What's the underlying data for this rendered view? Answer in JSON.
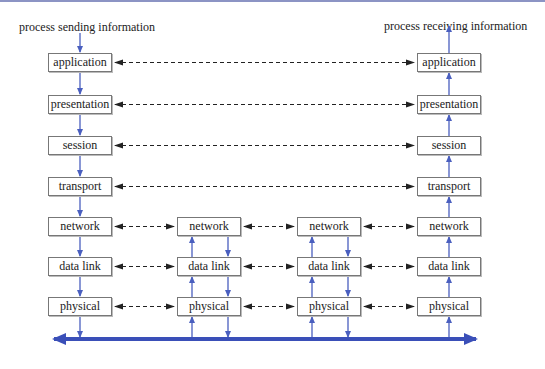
{
  "captions": {
    "sender": "process sending information",
    "receiver": "process receiving information"
  },
  "colors": {
    "flow": "#4a5fbf",
    "peer": "#222222",
    "bus": "#3a4fb8",
    "topbar": "#8c94c4"
  },
  "columns": {
    "sender": {
      "x": 48,
      "layers": [
        "application",
        "presentation",
        "session",
        "transport",
        "network",
        "data link",
        "physical"
      ]
    },
    "router1": {
      "x": 177,
      "layers": [
        "network",
        "data link",
        "physical"
      ]
    },
    "router2": {
      "x": 297,
      "layers": [
        "network",
        "data link",
        "physical"
      ]
    },
    "receiver": {
      "x": 417,
      "layers": [
        "application",
        "presentation",
        "session",
        "transport",
        "network",
        "data link",
        "physical"
      ]
    }
  },
  "layer_rows_y": [
    53,
    95,
    136,
    177,
    217,
    257,
    297
  ]
}
